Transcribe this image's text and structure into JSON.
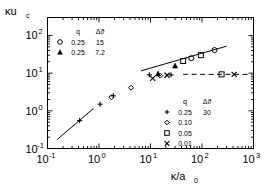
{
  "chart_data": {
    "type": "scatter",
    "title": "",
    "xlabel": "κ/a₀",
    "ylabel": "κu_c",
    "xscale": "log",
    "yscale": "log",
    "xlim": [
      0.1,
      1000
    ],
    "ylim": [
      0.1,
      300
    ],
    "grid": false,
    "xticks": [
      {
        "value": 0.1,
        "label": "10",
        "exp": "-1"
      },
      {
        "value": 1,
        "label": "10",
        "exp": "0"
      },
      {
        "value": 10,
        "label": "10",
        "exp": "1"
      },
      {
        "value": 100,
        "label": "10",
        "exp": "2"
      },
      {
        "value": 1000,
        "label": "10",
        "exp": "3"
      }
    ],
    "yticks": [
      {
        "value": 0.1,
        "label": "10",
        "exp": "-1"
      },
      {
        "value": 1,
        "label": "10",
        "exp": "0"
      },
      {
        "value": 10,
        "label": "10",
        "exp": "1"
      },
      {
        "value": 100,
        "label": "10",
        "exp": "2"
      }
    ],
    "series": [
      {
        "name": "q=0.25, dtheta=30",
        "marker": "plus",
        "q": "0.25",
        "dtheta": "30",
        "points": [
          [
            0.42,
            0.55
          ],
          [
            1.05,
            1.5
          ],
          [
            1.9,
            2.5
          ],
          [
            9.5,
            9.0
          ],
          [
            25.0,
            9.0
          ]
        ]
      },
      {
        "name": "q=0.10",
        "marker": "diamond",
        "q": "0.10",
        "dtheta": "",
        "points": [
          [
            1.75,
            2.3
          ],
          [
            4.2,
            4.1
          ],
          [
            15.5,
            8.6
          ]
        ]
      },
      {
        "name": "q=0.05",
        "marker": "square",
        "q": "0.05",
        "dtheta": "",
        "points": [
          [
            43.0,
            21.0
          ],
          [
            95.0,
            30.0
          ],
          [
            240.0,
            9.3
          ]
        ]
      },
      {
        "name": "q=0.01",
        "marker": "cross",
        "q": "0.01",
        "dtheta": "",
        "points": [
          [
            11.0,
            7.3
          ],
          [
            21.0,
            8.8
          ],
          [
            420.0,
            9.3
          ]
        ]
      },
      {
        "name": "q=0.25, dtheta=15",
        "marker": "circle-open",
        "q": "0.25",
        "dtheta": "15",
        "points": [
          [
            62.0,
            25.0
          ],
          [
            175.0,
            41.0
          ]
        ]
      },
      {
        "name": "q=0.25, dtheta=7.2",
        "marker": "triangle",
        "q": "0.25",
        "dtheta": "7.2",
        "points": [
          [
            14.0,
            9.5
          ],
          [
            30.0,
            15.5
          ]
        ]
      }
    ],
    "lines": [
      {
        "name": "lower-slope-line",
        "style": "solid",
        "points": [
          [
            0.155,
            0.175
          ],
          [
            0.78,
            1.15
          ]
        ]
      },
      {
        "name": "upper-slope-line",
        "style": "solid",
        "points": [
          [
            6.5,
            11.5
          ],
          [
            300.0,
            52.0
          ]
        ]
      },
      {
        "name": "plateau-line",
        "style": "dashed",
        "points": [
          [
            43.0,
            9.3
          ],
          [
            790.0,
            9.3
          ]
        ]
      }
    ],
    "legends": [
      {
        "name": "upper-legend",
        "headers": [
          "q",
          "Δϑ"
        ],
        "rows": [
          {
            "marker": "circle-open",
            "q": "0.25",
            "dtheta": "15"
          },
          {
            "marker": "triangle",
            "q": "0.25",
            "dtheta": "7.2"
          }
        ]
      },
      {
        "name": "lower-legend",
        "headers": [
          "q",
          "Δϑ"
        ],
        "rows": [
          {
            "marker": "plus",
            "q": "0.25",
            "dtheta": "30"
          },
          {
            "marker": "diamond",
            "q": "0.10",
            "dtheta": ""
          },
          {
            "marker": "square",
            "q": "0.05",
            "dtheta": ""
          },
          {
            "marker": "cross",
            "q": "0.01",
            "dtheta": ""
          }
        ]
      }
    ],
    "colors": {
      "axis": "#000000",
      "marker": "#000000",
      "background": "#ffffff"
    }
  }
}
